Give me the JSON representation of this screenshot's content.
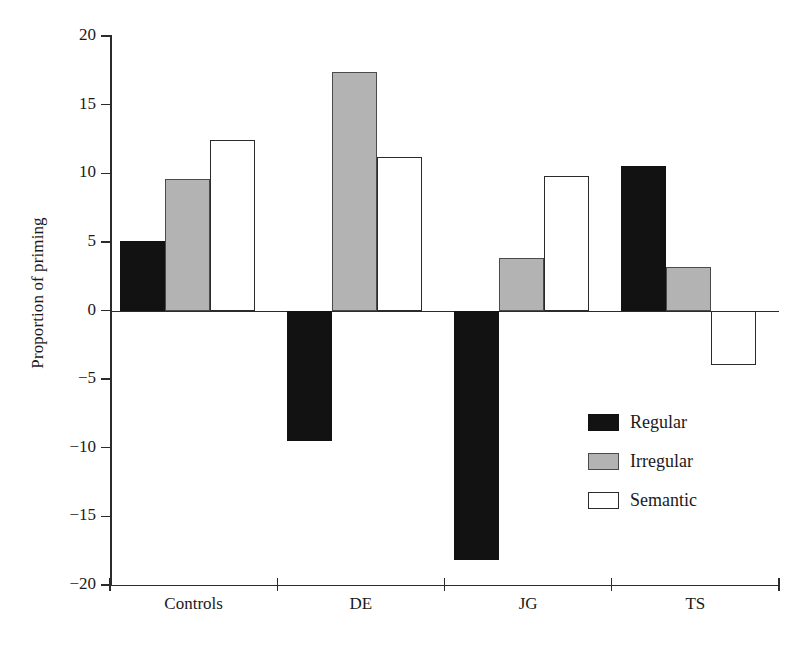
{
  "chart_data": {
    "type": "bar",
    "title": "",
    "subtitle": "",
    "xlabel": "",
    "ylabel": "Proportion of priming",
    "categories": [
      "Controls",
      "DE",
      "JG",
      "TS"
    ],
    "series": [
      {
        "name": "Regular",
        "color": "#121212",
        "values": [
          5.1,
          -9.5,
          -18.2,
          10.5
        ]
      },
      {
        "name": "Irregular",
        "color": "#b3b3b3",
        "values": [
          9.6,
          17.4,
          3.8,
          3.2
        ]
      },
      {
        "name": "Semantic",
        "color": "#ffffff",
        "values": [
          12.4,
          11.2,
          9.8,
          -4.0
        ]
      }
    ],
    "ylim": [
      -20,
      20
    ],
    "yticks": [
      20,
      15,
      10,
      5,
      0,
      -5,
      -10,
      -15,
      -20
    ],
    "ytick_labels": [
      "20",
      "15",
      "10",
      "5",
      "0",
      "−5",
      "−10",
      "−15",
      "−20"
    ],
    "grid": false,
    "legend_position": "inside-lower-right",
    "baseline": 0
  },
  "legend": {
    "items": [
      {
        "label": "Regular",
        "swatch": "black-filled-square"
      },
      {
        "label": "Irregular",
        "swatch": "gray-filled-square"
      },
      {
        "label": "Semantic",
        "swatch": "white-outlined-square"
      }
    ]
  },
  "axes": {
    "y_title": "Proportion of priming"
  }
}
